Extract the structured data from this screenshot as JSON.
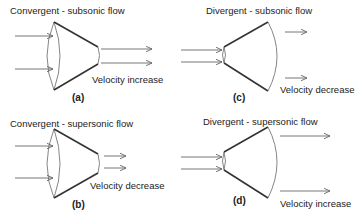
{
  "diagram": {
    "panels": [
      {
        "id": "a",
        "title": "Convergent - subsonic flow",
        "nozzle_type": "convergent",
        "flow_regime": "subsonic",
        "result": "Velocity increase",
        "tag": "(a)"
      },
      {
        "id": "b",
        "title": "Convergent - supersonic flow",
        "nozzle_type": "convergent",
        "flow_regime": "supersonic",
        "result": "Velocity decrease",
        "tag": "(b)"
      },
      {
        "id": "c",
        "title": "Divergent - subsonic flow",
        "nozzle_type": "divergent",
        "flow_regime": "subsonic",
        "result": "Velocity decrease",
        "tag": "(c)"
      },
      {
        "id": "d",
        "title": "Divergent - supersonic flow",
        "nozzle_type": "divergent",
        "flow_regime": "supersonic",
        "result": "Velocity increase",
        "tag": "(d)"
      }
    ],
    "colors": {
      "outline": "#333333",
      "arrow": "#666666",
      "text": "#222222",
      "background": "#ffffff"
    }
  }
}
